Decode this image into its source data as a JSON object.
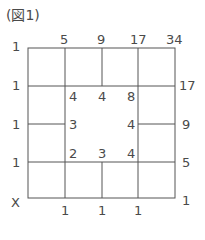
{
  "title": "(図1)",
  "top_labels": [
    "1",
    "5",
    "9",
    "17",
    "34"
  ],
  "left_labels": [
    "1",
    "1",
    "1",
    "1",
    "X"
  ],
  "right_labels": [
    "17",
    "9",
    "5",
    "1"
  ],
  "bottom_labels": [
    "1",
    "1",
    "1"
  ],
  "inner": {
    "row1": [
      "4",
      "4",
      "8"
    ],
    "row2_left": "3",
    "row2_right": "4",
    "row3": [
      "2",
      "3",
      "4"
    ]
  },
  "line_color": "#555555"
}
